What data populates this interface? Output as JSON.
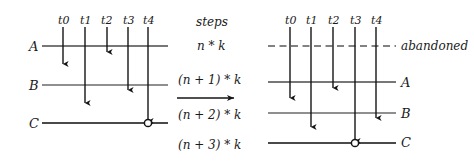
{
  "figure": {
    "type": "timeline-diagram"
  },
  "left_diagram": {
    "time_labels": [
      "t0",
      "t1",
      "t2",
      "t3",
      "t4"
    ],
    "track_labels": [
      "A",
      "B",
      "C"
    ],
    "marker": "circle-at-t4-on-C"
  },
  "middle": {
    "header": "steps",
    "steps": [
      "n * k",
      "(n + 1) * k",
      "(n + 2) * k",
      "(n + 3) * k"
    ],
    "transition_arrow": "right-arrow"
  },
  "right_diagram": {
    "time_labels": [
      "t0",
      "t1",
      "t2",
      "t3",
      "t4"
    ],
    "track_labels": [
      "abandoned",
      "A",
      "B",
      "C"
    ],
    "marker": "circle-at-t3-on-C"
  },
  "colors": {
    "ink": "#1a1a1a",
    "line": "#4a4a4a",
    "background": "#ffffff"
  }
}
